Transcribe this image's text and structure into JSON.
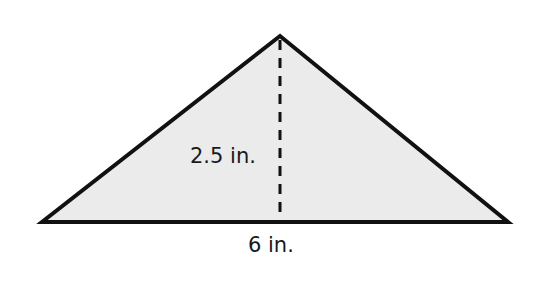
{
  "diagram": {
    "shape": "triangle",
    "fill_color": "#ebebeb",
    "stroke_color": "#111111",
    "vertices": {
      "apex": [
        280,
        36
      ],
      "base_left": [
        42,
        222
      ],
      "base_right": [
        508,
        222
      ]
    },
    "height_line": {
      "style": "dashed",
      "x": 280,
      "y1": 36,
      "y2": 222
    },
    "labels": {
      "height": "2.5 in.",
      "base": "6 in."
    }
  }
}
